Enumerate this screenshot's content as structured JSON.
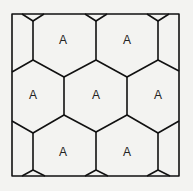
{
  "diagram": {
    "type": "hexagonal-tiling",
    "line_color": "#111111",
    "background": "#f3f3f1",
    "cells": [
      {
        "label": "A",
        "x": 63,
        "y": 40
      },
      {
        "label": "A",
        "x": 127,
        "y": 40
      },
      {
        "label": "A",
        "x": 33,
        "y": 95
      },
      {
        "label": "A",
        "x": 96,
        "y": 95
      },
      {
        "label": "A",
        "x": 158,
        "y": 95
      },
      {
        "label": "A",
        "x": 63,
        "y": 152
      },
      {
        "label": "A",
        "x": 127,
        "y": 152
      }
    ]
  }
}
